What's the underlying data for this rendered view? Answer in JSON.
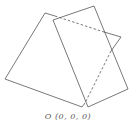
{
  "diagram": {
    "label": "O (0, 0, 0)",
    "stroke_color": "#555555",
    "shapes": [
      {
        "name": "back-rectangle",
        "corners": [
          [
            45,
            13
          ],
          [
            121,
            37
          ],
          [
            82,
            107
          ],
          [
            5,
            79
          ]
        ],
        "hidden_segments": [
          [
            [
              55,
              16
            ],
            [
              104,
              32
            ]
          ],
          [
            [
              111,
              51
            ],
            [
              85,
              103
            ]
          ]
        ]
      },
      {
        "name": "front-rectangle",
        "corners": [
          [
            53,
            20
          ],
          [
            94,
            6
          ],
          [
            128,
            89
          ],
          [
            88,
            107
          ]
        ]
      }
    ]
  }
}
